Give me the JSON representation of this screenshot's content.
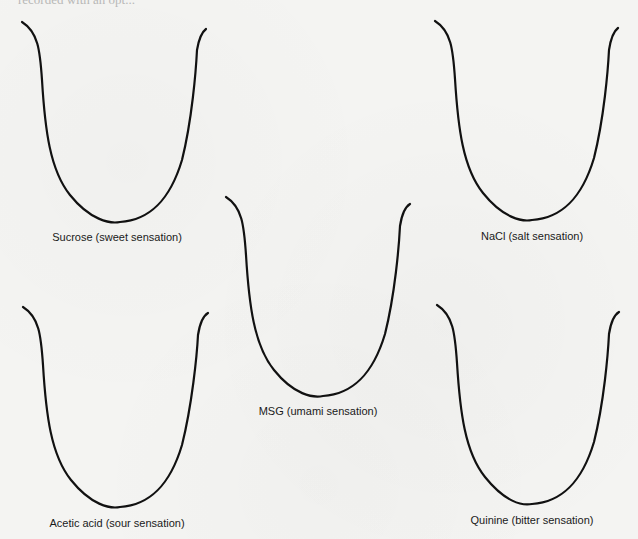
{
  "figure": {
    "cutoff_header_text": "recorded with an opt...",
    "curves": [
      {
        "id": "sucrose",
        "label": "Sucrose (sweet sensation)",
        "taste": "sweet"
      },
      {
        "id": "nacl",
        "label": "NaCl (salt sensation)",
        "taste": "salt"
      },
      {
        "id": "msg",
        "label": "MSG (umami sensation)",
        "taste": "umami"
      },
      {
        "id": "acetic",
        "label": "Acetic acid (sour sensation)",
        "taste": "sour"
      },
      {
        "id": "quinine",
        "label": "Quinine (bitter sensation)",
        "taste": "bitter"
      }
    ],
    "colors": {
      "line": "#111111",
      "background": "#f4f4f2",
      "text": "#1a1a1a"
    }
  }
}
